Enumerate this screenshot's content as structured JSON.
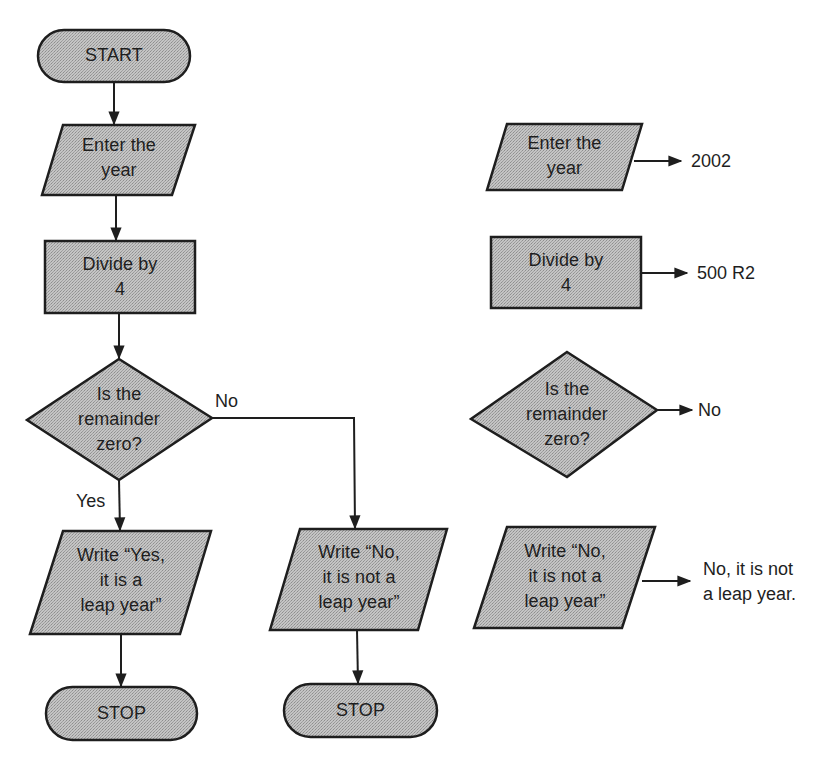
{
  "colors": {
    "shape_fill": "#bababa",
    "stroke": "#1e1e1e",
    "background": "#ffffff"
  },
  "main_flowchart": {
    "start": {
      "label": "START",
      "shape": "terminator"
    },
    "input": {
      "label": "Enter the\nyear",
      "shape": "parallelogram"
    },
    "process": {
      "label": "Divide by\n4",
      "shape": "rectangle"
    },
    "decision": {
      "label": "Is the\nremainder\nzero?",
      "shape": "diamond"
    },
    "branch_yes_label": "Yes",
    "branch_no_label": "No",
    "output_yes": {
      "label": "Write “Yes,\nit is a\nleap year”",
      "shape": "parallelogram"
    },
    "output_no": {
      "label": "Write “No,\nit is not a\nleap year”",
      "shape": "parallelogram"
    },
    "stop_yes": {
      "label": "STOP",
      "shape": "terminator"
    },
    "stop_no": {
      "label": "STOP",
      "shape": "terminator"
    }
  },
  "trace_example": {
    "input": {
      "label": "Enter the\nyear",
      "result": "2002"
    },
    "process": {
      "label": "Divide by\n4",
      "result": "500 R2"
    },
    "decision": {
      "label": "Is the\nremainder\nzero?",
      "result": "No"
    },
    "output": {
      "label": "Write “No,\nit is not a\nleap year”",
      "result": "No, it is not\na leap year."
    }
  }
}
